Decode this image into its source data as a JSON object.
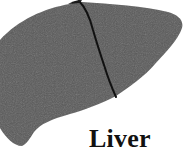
{
  "figure": {
    "organ": "liver",
    "label": "Liver",
    "colors": {
      "background": "#ffffff",
      "organ_fill": "#5a5a5a",
      "fissure": "#111111",
      "label": "#111111"
    }
  }
}
